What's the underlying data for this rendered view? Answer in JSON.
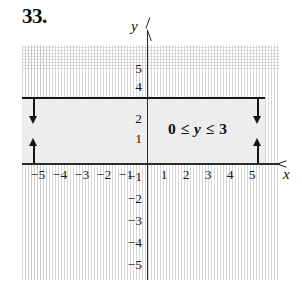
{
  "figure": {
    "problem_number": "33.",
    "inequality": {
      "lower_bound": "0",
      "relation_left": "≤",
      "variable": "y",
      "relation_right": "≤",
      "upper_bound": "3",
      "full_text": "0 ≤ y ≤ 3"
    },
    "axis_labels": {
      "x": "x",
      "y": "y"
    },
    "colors": {
      "shading": "#ededed",
      "boundary_line": "#141414",
      "axis": "#2b2b2b",
      "grid": "#c9c9c9",
      "text": "#0d0d0d"
    }
  },
  "chart_data": {
    "type": "area",
    "title": "",
    "subtitle": "",
    "xlabel": "x",
    "ylabel": "y",
    "xlim": [
      -5.7,
      6.0
    ],
    "ylim": [
      -5.7,
      5.7
    ],
    "grid": true,
    "legend": "none",
    "annotations": [
      {
        "text": "0 ≤ y ≤ 3",
        "x": 3.0,
        "y": 2.0
      },
      {
        "text": "33.",
        "x": -5.5,
        "y": 6.4
      }
    ],
    "x_ticks": [
      -5,
      -4,
      -3,
      -2,
      -1,
      1,
      2,
      3,
      4,
      5
    ],
    "x_tick_labels": [
      "−5",
      "−4",
      "−3",
      "−2",
      "−1",
      "1",
      "2",
      "3",
      "4",
      "5"
    ],
    "y_ticks": [
      5,
      4,
      2,
      1,
      -1,
      -2,
      -3,
      -4,
      -5
    ],
    "y_tick_labels": [
      "5",
      "4",
      "2",
      "1",
      "−1",
      "−2",
      "−3",
      "−4",
      "−5"
    ],
    "shaded_regions": [
      {
        "name": "solution-band",
        "inequality": "0 ≤ y ≤ 3",
        "y_min": 0,
        "y_max": 3,
        "x_min": -5.7,
        "x_max": 5.4,
        "fill": "#ededed",
        "boundary_style": "solid",
        "boundary_included": true
      }
    ],
    "boundary_lines": [
      {
        "name": "upper-boundary",
        "equation": "y = 3",
        "style": "solid",
        "included": true
      },
      {
        "name": "lower-boundary",
        "equation": "y = 0",
        "style": "solid",
        "included": true
      }
    ],
    "direction_arrows": [
      {
        "name": "left-down-arrow",
        "from": "y = 3",
        "direction": "down",
        "x": -5.3
      },
      {
        "name": "left-up-arrow",
        "from": "y = 0",
        "direction": "up",
        "x": -5.3
      },
      {
        "name": "right-down-arrow",
        "from": "y = 3",
        "direction": "down",
        "x": 4.9
      },
      {
        "name": "right-up-arrow",
        "from": "y = 0",
        "direction": "up",
        "x": 4.9
      }
    ]
  },
  "tick_positions": {
    "x_negative": [
      {
        "label": "−5",
        "left": 27
      },
      {
        "label": "−4",
        "left": 49
      },
      {
        "label": "−3",
        "left": 71
      },
      {
        "label": "−2",
        "left": 93
      },
      {
        "label": "−1",
        "left": 115
      }
    ],
    "x_positive": [
      {
        "label": "1",
        "left": 153
      },
      {
        "label": "2",
        "left": 175
      },
      {
        "label": "3",
        "left": 197
      },
      {
        "label": "4",
        "left": 219
      },
      {
        "label": "5",
        "left": 241
      }
    ],
    "y_positive": [
      {
        "label": "5",
        "top": 62
      },
      {
        "label": "4",
        "top": 80
      },
      {
        "label": "2",
        "top": 112
      },
      {
        "label": "1",
        "top": 132
      }
    ],
    "y_negative": [
      {
        "label": "−1",
        "top": 170
      },
      {
        "label": "−2",
        "top": 192
      },
      {
        "label": "−3",
        "top": 214
      },
      {
        "label": "−4",
        "top": 236
      },
      {
        "label": "−5",
        "top": 258
      }
    ]
  }
}
